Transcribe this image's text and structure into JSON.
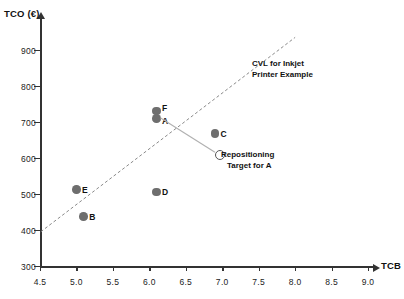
{
  "chart_data": {
    "type": "scatter",
    "title": "",
    "xlabel": "TCB",
    "ylabel": "TCO (€)",
    "xlim": [
      4.5,
      9.0
    ],
    "ylim": [
      300,
      950
    ],
    "xticks": [
      "4.5",
      "5.0",
      "5.5",
      "6.0",
      "6.5",
      "7.0",
      "7.5",
      "8.0",
      "8.5",
      "9.0"
    ],
    "xtick_values": [
      4.5,
      5.0,
      5.5,
      6.0,
      6.5,
      7.0,
      7.5,
      8.0,
      8.5,
      9.0
    ],
    "yticks": [
      "300",
      "400",
      "500",
      "600",
      "700",
      "800",
      "900"
    ],
    "ytick_values": [
      300,
      400,
      500,
      600,
      700,
      800,
      900
    ],
    "grid": false,
    "legend": "none",
    "points": [
      {
        "label": "F",
        "x": 6.1,
        "y": 730,
        "marker": "filled-circle",
        "label_pos": "right-top"
      },
      {
        "label": "A",
        "x": 6.1,
        "y": 710,
        "marker": "filled-circle",
        "label_pos": "right-bottom"
      },
      {
        "label": "C",
        "x": 6.9,
        "y": 668,
        "marker": "filled-circle",
        "label_pos": "right"
      },
      {
        "label": "E",
        "x": 5.0,
        "y": 512,
        "marker": "filled-circle",
        "label_pos": "right"
      },
      {
        "label": "D",
        "x": 6.1,
        "y": 505,
        "marker": "filled-circle",
        "label_pos": "right"
      },
      {
        "label": "B",
        "x": 5.1,
        "y": 437,
        "marker": "filled-circle",
        "label_pos": "right"
      },
      {
        "label": "",
        "x": 6.95,
        "y": 612,
        "marker": "open-circle",
        "label_pos": "right"
      }
    ],
    "lines": [
      {
        "name": "cvl-trend-line",
        "style": "dashed",
        "x1": 4.51,
        "y1": 395,
        "x2": 8.0,
        "y2": 935
      },
      {
        "name": "repositioning-arrow",
        "style": "solid-thin",
        "x1": 6.15,
        "y1": 712,
        "x2": 6.9,
        "y2": 616
      }
    ],
    "annotations": [
      {
        "name": "cvl-annotation",
        "line1": "CVL for Inkjet",
        "line2": "Printer Example"
      },
      {
        "name": "repositioning-annotation",
        "line1": "Repositioning",
        "line2": "Target for A"
      }
    ]
  }
}
